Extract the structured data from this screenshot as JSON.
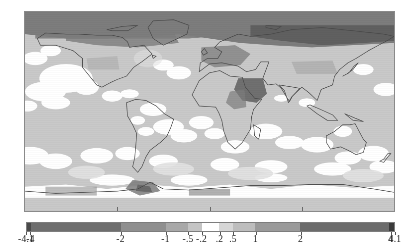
{
  "figure": {
    "kind": "global-anomaly-map",
    "title": "",
    "units": "",
    "map_projection": "equirectangular"
  },
  "chart_data": {
    "type": "heatmap",
    "title": "",
    "subtitle": "",
    "xlabel": "",
    "ylabel": "",
    "projection": "equirectangular",
    "lon_range": [
      -180,
      180
    ],
    "lat_range": [
      -90,
      90
    ],
    "grid": false,
    "legend_position": "bottom",
    "colormap": "grayscale-diverging",
    "colorbar": {
      "orientation": "horizontal",
      "vmin": -4.1,
      "vmax": 4.1,
      "tick_labels": [
        "-4.1",
        "-4",
        "-2",
        "-1",
        "-.5",
        "-.2",
        ".2",
        ".5",
        "1",
        "2",
        "4",
        "4.1"
      ],
      "tick_values": [
        -4.1,
        -4,
        -2,
        -1,
        -0.5,
        -0.2,
        0.2,
        0.5,
        1,
        2,
        4,
        4.1
      ],
      "boundaries": [
        -4.1,
        -4,
        -2,
        -1,
        -0.5,
        -0.2,
        0.2,
        0.5,
        1,
        2,
        4,
        4.1
      ],
      "segment_colors": [
        "#4a4a4a",
        "#6e6e6e",
        "#8f8f8f",
        "#a8a8a8",
        "#c4c4c4",
        "#ffffff",
        "#d6d6d6",
        "#bdbdbd",
        "#9a9a9a",
        "#6b6b6b",
        "#3a3a3a"
      ]
    },
    "map_field": {
      "description": "Shaded anomaly field over land and ocean",
      "background_value": 0.5,
      "background_color": "#c9c9c9",
      "near_zero_color": "#ffffff",
      "strong_positive_color": "#7d7d7d",
      "strongest_positive_color": "#5a5a5a",
      "negative_color": "#e2e2e2"
    },
    "axis_ticks_bottom": [
      0.25,
      0.5,
      0.75
    ],
    "coastline_color": "#4a4a4a"
  },
  "map_regions": [
    {
      "name": "arctic-siberia-warm-band",
      "value_band": "2 to 4"
    },
    {
      "name": "northern-canada-warm-band",
      "value_band": "1 to 2"
    },
    {
      "name": "europe-warm-patch",
      "value_band": "1 to 2"
    },
    {
      "name": "arabia-northeast-africa-warm-patch",
      "value_band": "2 to 4"
    },
    {
      "name": "tropical-pacific-near-zero",
      "value_band": "-.2 to .2"
    },
    {
      "name": "southern-ocean-near-zero",
      "value_band": "-.2 to .2"
    },
    {
      "name": "antarctic-peninsula-warm-patch",
      "value_band": "1 to 2"
    },
    {
      "name": "southern-ocean-cool-band",
      "value_band": "-.5 to -.2"
    }
  ]
}
